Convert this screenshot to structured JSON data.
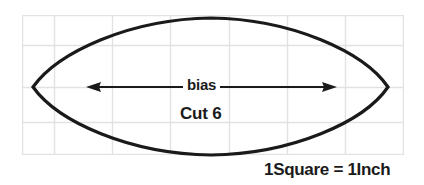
{
  "figure": {
    "kind": "sewing-pattern-piece",
    "shape_name": "lens-leaf-petal-piece",
    "bias_label": "bias",
    "cut_label": "Cut 6",
    "scale_caption": "1Square = 1Inch",
    "colors": {
      "outline": "#1a1a1a",
      "grid_line": "#e2e2e2",
      "background": "#ffffff",
      "text": "#1a1a1a",
      "arrow": "#1a1a1a"
    },
    "grid": {
      "columns": 7,
      "rows": 4,
      "square_inches": 1,
      "x_lines": [
        22,
        54,
        112,
        170,
        229,
        287,
        345,
        404
      ],
      "y_lines": [
        15,
        45,
        87,
        122,
        155
      ]
    },
    "outline_points": {
      "left_tip_x": 33,
      "left_tip_y": 87,
      "right_tip_x": 388,
      "right_tip_y": 87,
      "top_y": 18,
      "bottom_y": 155,
      "apex_x": 211
    },
    "bias_arrow": {
      "left_tip_x": 86,
      "right_tip_x": 337,
      "y": 87,
      "double_headed": true
    }
  }
}
